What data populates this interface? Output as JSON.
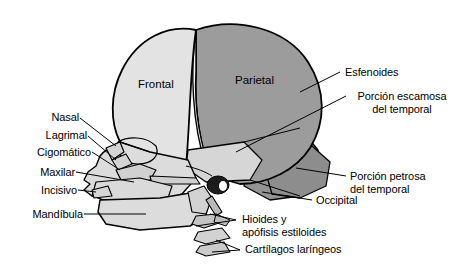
{
  "figure": {
    "type": "anatomical-diagram",
    "language": "es",
    "colors": {
      "background": "#ffffff",
      "outline": "#000000",
      "frontal_fill": "#e0e0e0",
      "parietal_fill": "#9e9e9e",
      "temporal_fill": "#9e9e9e",
      "occipital_fill": "#8f8f8f",
      "face_fill": "#d9d9d9",
      "cartilage_fill": "#bdbdbd",
      "meatus_fill": "#1a1a1a"
    }
  },
  "labels_left": [
    {
      "key": "nasal",
      "text": "Nasal"
    },
    {
      "key": "lagrimal",
      "text": "Lagrimal"
    },
    {
      "key": "cigomatico",
      "text": "Cigomático"
    },
    {
      "key": "maxilar",
      "text": "Maxilar"
    },
    {
      "key": "incisivo",
      "text": "Incisivo"
    },
    {
      "key": "mandibula",
      "text": "Mandíbula"
    }
  ],
  "labels_right": [
    {
      "key": "esfenoides",
      "text": "Esfenoides"
    },
    {
      "key": "porcion-escamosa",
      "line1": "Porción escamosa",
      "line2": "del temporal"
    },
    {
      "key": "porcion-petrosa",
      "line1": "Porción petrosa",
      "line2": "del temporal"
    },
    {
      "key": "occipital",
      "text": "Occipital"
    }
  ],
  "labels_bottom": [
    {
      "key": "hioides",
      "line1": "Hioides y",
      "line2": "apófisis estiloides"
    },
    {
      "key": "cartilagos",
      "text": "Cartílagos laríngeos"
    }
  ],
  "labels_inner": [
    {
      "key": "frontal",
      "text": "Frontal"
    },
    {
      "key": "parietal",
      "text": "Parietal"
    }
  ]
}
